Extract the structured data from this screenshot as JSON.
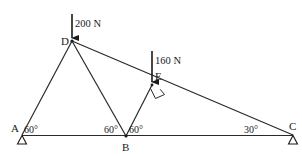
{
  "diagram": {
    "type": "truss",
    "colors": {
      "line": "#2a2a2a",
      "text": "#1a1a1a",
      "background": "#ffffff"
    },
    "nodes": {
      "A": {
        "label": "A"
      },
      "B": {
        "label": "B"
      },
      "C": {
        "label": "C"
      },
      "D": {
        "label": "D"
      },
      "E": {
        "label": "E"
      }
    },
    "members": [
      "AD",
      "DB",
      "BE",
      "DC",
      "AC"
    ],
    "loads": [
      {
        "node": "D",
        "label": "200 N"
      },
      {
        "node": "E",
        "label": "160 N"
      }
    ],
    "angles": {
      "A": "60°",
      "B_left": "60°",
      "B_right": "60°",
      "C": "30°"
    },
    "right_angle_at": "E",
    "supports": [
      "A",
      "C"
    ]
  }
}
